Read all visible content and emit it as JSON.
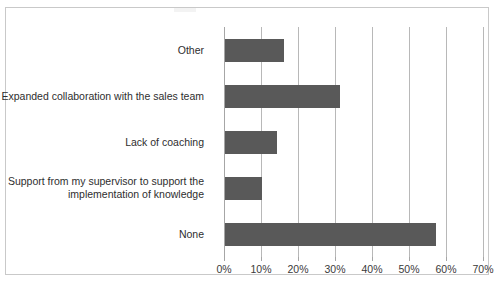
{
  "chart_data": {
    "type": "bar",
    "orientation": "horizontal",
    "title": "",
    "xlabel": "",
    "ylabel": "",
    "categories": [
      "Other",
      "Expanded collaboration with the sales team",
      "Lack of coaching",
      "Support from my supervisor to support the\nimplementation of knowledge",
      "None"
    ],
    "values": [
      16,
      31,
      14,
      10,
      57
    ],
    "value_suffix": "%",
    "xlim": [
      0,
      70
    ],
    "xticks": [
      0,
      10,
      20,
      30,
      40,
      50,
      60,
      70
    ],
    "xtick_labels": [
      "0%",
      "10%",
      "20%",
      "30%",
      "40%",
      "50%",
      "60%",
      "70%"
    ],
    "grid": true,
    "grid_axis": "x",
    "legend": false,
    "legend_position": "none",
    "bar_color": "#595959",
    "grid_color": "#b8b8b8",
    "axis_color": "#a6a6a6",
    "border_color": "#c9c9c9",
    "background_color": "#ffffff"
  }
}
